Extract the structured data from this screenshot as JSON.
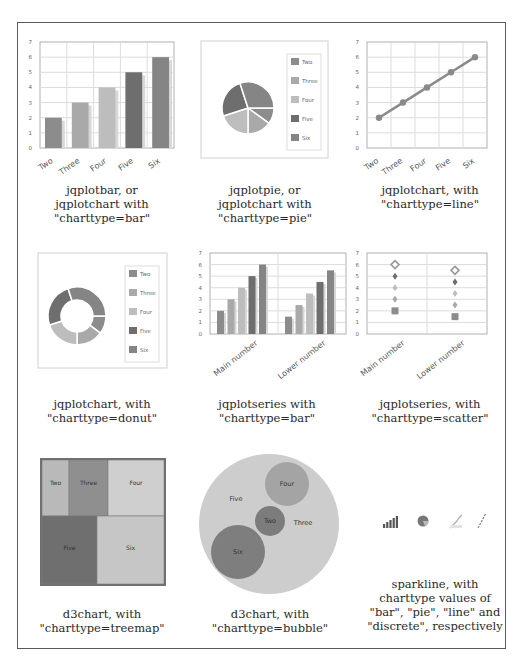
{
  "captions": {
    "bar": [
      "jqplotbar, or",
      "jqplotchart with",
      "\"charttype=bar\""
    ],
    "pie": [
      "jqplotpie, or",
      "jqplotchart with",
      "\"charttype=pie\""
    ],
    "line": [
      "jqplotchart, with",
      "\"charttype=line\""
    ],
    "donut": [
      "jqplotchart, with",
      "\"charttype=donut\""
    ],
    "series_bar": [
      "jqplotseries with",
      "\"charttype=bar\""
    ],
    "scatter": [
      "jqplotseries, with",
      "\"charttype=scatter\""
    ],
    "treemap": [
      "d3chart, with",
      "\"charttype=treemap\""
    ],
    "bubble": [
      "d3chart, with",
      "\"charttype=bubble\""
    ],
    "sparkline": [
      "sparkline, with",
      "charttype values of",
      "\"bar\", \"pie\", \"line\" and",
      "\"discrete\", respectively"
    ]
  },
  "colors": {
    "Two": "#8c8c8c",
    "Three": "#a9a9a9",
    "Four": "#bdbdbd",
    "Five": "#6e6e6e",
    "Six": "#858585",
    "grid": "#dcdcdc",
    "axis": "#b0b0b0"
  },
  "chart_data": [
    {
      "type": "bar",
      "id": "jqplotbar",
      "categories": [
        "Two",
        "Three",
        "Four",
        "Five",
        "Six"
      ],
      "values": [
        2,
        3,
        4,
        5,
        6
      ],
      "ylim": [
        0,
        7
      ],
      "yticks": [
        0,
        1,
        2,
        3,
        4,
        5,
        6,
        7
      ],
      "grid": true
    },
    {
      "type": "pie",
      "id": "jqplotpie",
      "categories": [
        "Two",
        "Three",
        "Four",
        "Five",
        "Six"
      ],
      "values": [
        2,
        3,
        4,
        5,
        6
      ],
      "legend": [
        "Two",
        "Three",
        "Four",
        "Five",
        "Six"
      ],
      "legend_position": "right"
    },
    {
      "type": "line",
      "id": "jqplotchart-line",
      "categories": [
        "Two",
        "Three",
        "Four",
        "Five",
        "Six"
      ],
      "values": [
        2,
        3,
        4,
        5,
        6
      ],
      "ylim": [
        0,
        7
      ],
      "yticks": [
        0,
        1,
        2,
        3,
        4,
        5,
        6,
        7
      ],
      "grid": true
    },
    {
      "type": "pie",
      "subtype": "donut",
      "id": "jqplotchart-donut",
      "categories": [
        "Two",
        "Three",
        "Four",
        "Five",
        "Six"
      ],
      "values": [
        2,
        3,
        4,
        5,
        6
      ],
      "legend": [
        "Two",
        "Three",
        "Four",
        "Five",
        "Six"
      ],
      "legend_position": "right"
    },
    {
      "type": "bar",
      "id": "jqplotseries-bar",
      "categories": [
        "Main number",
        "Lower number"
      ],
      "series": [
        {
          "name": "Two",
          "values": [
            2,
            1.5
          ]
        },
        {
          "name": "Three",
          "values": [
            3,
            2.5
          ]
        },
        {
          "name": "Four",
          "values": [
            4,
            3.5
          ]
        },
        {
          "name": "Five",
          "values": [
            5,
            4.5
          ]
        },
        {
          "name": "Six",
          "values": [
            6,
            5.5
          ]
        }
      ],
      "ylim": [
        0,
        7
      ],
      "yticks": [
        0,
        1,
        2,
        3,
        4,
        5,
        6,
        7
      ],
      "grid": true
    },
    {
      "type": "scatter",
      "id": "jqplotseries-scatter",
      "categories": [
        "Main number",
        "Lower number"
      ],
      "series": [
        {
          "name": "Two",
          "values": [
            2,
            1.5
          ],
          "marker": "square"
        },
        {
          "name": "Three",
          "values": [
            3,
            2.5
          ],
          "marker": "diamond"
        },
        {
          "name": "Four",
          "values": [
            4,
            3.5
          ],
          "marker": "diamond"
        },
        {
          "name": "Five",
          "values": [
            5,
            4.5
          ],
          "marker": "diamond"
        },
        {
          "name": "Six",
          "values": [
            6,
            5.5
          ],
          "marker": "open-diamond"
        }
      ],
      "ylim": [
        0,
        7
      ],
      "yticks": [
        0,
        1,
        2,
        3,
        4,
        5,
        6,
        7
      ],
      "grid": true
    },
    {
      "type": "heatmap",
      "subtype": "treemap",
      "id": "d3chart-treemap",
      "categories": [
        "Two",
        "Three",
        "Four",
        "Five",
        "Six"
      ],
      "values": [
        2,
        3,
        4,
        5,
        6
      ]
    },
    {
      "type": "scatter",
      "subtype": "bubble",
      "id": "d3chart-bubble",
      "categories": [
        "Two",
        "Three",
        "Four",
        "Five",
        "Six"
      ],
      "values": [
        2,
        3,
        4,
        5,
        6
      ]
    },
    {
      "type": "bar",
      "subtype": "sparkline",
      "id": "sparkline-set",
      "sparklines": [
        "bar",
        "pie",
        "line",
        "discrete"
      ]
    }
  ]
}
